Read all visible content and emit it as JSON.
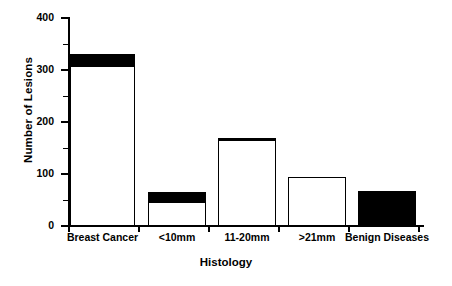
{
  "chart_data": {
    "type": "bar",
    "title": "",
    "subtitle": "",
    "xlabel": "Histology",
    "ylabel": "Number of Lesions",
    "categories": [
      "Breast  Cancer",
      "<10mm",
      "11-20mm",
      ">21mm",
      "Benign  Diseases"
    ],
    "ylim": [
      0,
      400
    ],
    "ytick_labels": [
      "0",
      "100",
      "200",
      "300",
      "400"
    ],
    "ytick_values": [
      0,
      100,
      200,
      300,
      400
    ],
    "yminor_values": [
      50,
      150,
      250,
      350
    ],
    "grid": false,
    "legend": null,
    "stacked": true,
    "series": [
      {
        "name": "white-segment",
        "color": "#FFFFFF",
        "values": [
          305,
          45,
          165,
          92,
          0
        ]
      },
      {
        "name": "black-segment",
        "color": "#000000",
        "values": [
          25,
          20,
          4,
          0,
          68
        ]
      }
    ],
    "totals": [
      330,
      65,
      169,
      92,
      68
    ],
    "bar_edge_color": "#000000",
    "axis_color": "#000000",
    "background": "#FFFFFF"
  }
}
